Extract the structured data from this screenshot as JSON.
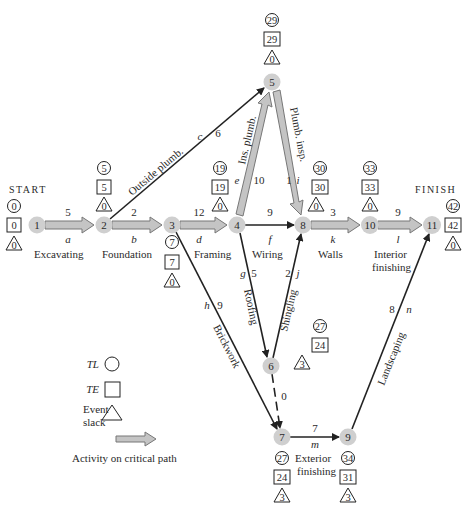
{
  "labels": {
    "start": "START",
    "finish": "FINISH"
  },
  "colors": {
    "node_fill": "#cfcfcf",
    "critical_fill": "#c4c4c4",
    "critical_stroke": "#777777",
    "line": "#222222"
  },
  "nodes": [
    {
      "id": "1",
      "x": 37,
      "y": 225,
      "TL": "0",
      "TE": "0",
      "slack": "0"
    },
    {
      "id": "2",
      "x": 104,
      "y": 225,
      "TL": "5",
      "TE": "5",
      "slack": "0"
    },
    {
      "id": "3",
      "x": 172,
      "y": 225,
      "TL": "7",
      "TE": "7",
      "slack": "0"
    },
    {
      "id": "4",
      "x": 237,
      "y": 225,
      "TL": "19",
      "TE": "19",
      "slack": "0"
    },
    {
      "id": "5",
      "x": 272,
      "y": 82,
      "TL": "29",
      "TE": "29",
      "slack": "0"
    },
    {
      "id": "6",
      "x": 271,
      "y": 366,
      "TL": "27",
      "TE": "24",
      "slack": "3"
    },
    {
      "id": "7",
      "x": 282,
      "y": 437,
      "TL": "27",
      "TE": "24",
      "slack": "3"
    },
    {
      "id": "8",
      "x": 303,
      "y": 225,
      "TL": "30",
      "TE": "30",
      "slack": "0"
    },
    {
      "id": "9",
      "x": 348,
      "y": 437,
      "TL": "34",
      "TE": "31",
      "slack": "3"
    },
    {
      "id": "10",
      "x": 370,
      "y": 225,
      "TL": "33",
      "TE": "33",
      "slack": "0"
    },
    {
      "id": "11",
      "x": 432,
      "y": 225,
      "TL": "42",
      "TE": "42",
      "slack": "0"
    }
  ],
  "activities": [
    {
      "letter": "a",
      "name": "Excavating",
      "duration": "5",
      "from": "1",
      "to": "2",
      "critical": true
    },
    {
      "letter": "b",
      "name": "Foundation",
      "duration": "2",
      "from": "2",
      "to": "3",
      "critical": true
    },
    {
      "letter": "c",
      "name": "Outside plumb.",
      "duration": "6",
      "from": "2",
      "to": "5",
      "critical": false
    },
    {
      "letter": "d",
      "name": "Framing",
      "duration": "12",
      "from": "3",
      "to": "4",
      "critical": true
    },
    {
      "letter": "e",
      "name": "Ins. plumb.",
      "duration": "10",
      "from": "4",
      "to": "5",
      "critical": true
    },
    {
      "letter": "f",
      "name": "Wiring",
      "duration": "9",
      "from": "4",
      "to": "8",
      "critical": false
    },
    {
      "letter": "g",
      "name": "Roofing",
      "duration": "5",
      "from": "4",
      "to": "6",
      "critical": false
    },
    {
      "letter": "h",
      "name": "Brickwork",
      "duration": "9",
      "from": "3",
      "to": "7",
      "critical": false
    },
    {
      "letter": "i",
      "name": "Plumb. insp.",
      "duration": "1",
      "from": "5",
      "to": "8",
      "critical": true
    },
    {
      "letter": "j",
      "name": "Shingling",
      "duration": "2",
      "from": "6",
      "to": "8",
      "critical": false
    },
    {
      "letter": "k",
      "name": "Walls",
      "duration": "3",
      "from": "8",
      "to": "10",
      "critical": true
    },
    {
      "letter": "l",
      "name": "Interior finishing",
      "duration": "9",
      "from": "10",
      "to": "11",
      "critical": true
    },
    {
      "letter": "m",
      "name": "Exterior finishing",
      "duration": "7",
      "from": "7",
      "to": "9",
      "critical": false
    },
    {
      "letter": "n",
      "name": "Landscaping",
      "duration": "8",
      "from": "9",
      "to": "11",
      "critical": false
    },
    {
      "letter": "",
      "name": "Dummy",
      "duration": "0",
      "from": "6",
      "to": "7",
      "critical": false,
      "dummy": true
    }
  ],
  "legend": {
    "tl": "TL",
    "te": "TE",
    "slack_line1": "Event",
    "slack_line2": "slack",
    "critical": "Activity on critical path"
  }
}
